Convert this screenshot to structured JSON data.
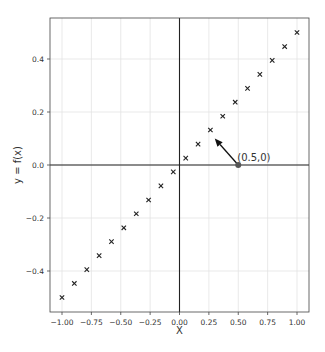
{
  "chart_data": {
    "type": "scatter",
    "title": "",
    "xlabel": "X",
    "ylabel": "y = f(x)",
    "xlim": [
      -1.1,
      1.1
    ],
    "ylim": [
      -0.555,
      0.555
    ],
    "grid": true,
    "legend": null,
    "x_ticks": [
      -1.0,
      -0.75,
      -0.5,
      -0.25,
      0.0,
      0.25,
      0.5,
      0.75,
      1.0
    ],
    "x_tick_labels": [
      "−1.00",
      "−0.75",
      "−0.50",
      "−0.25",
      "0.00",
      "0.25",
      "0.50",
      "0.75",
      "1.00"
    ],
    "y_ticks": [
      -0.4,
      -0.2,
      0.0,
      0.2,
      0.4
    ],
    "y_tick_labels": [
      "−0.4",
      "−0.2",
      "0.0",
      "0.2",
      "0.4"
    ],
    "reference_lines": {
      "axhline_y": 0.0,
      "axvline_x": 0.0
    },
    "series": [
      {
        "name": "f(x)",
        "marker": "x",
        "color": "#222222",
        "x": [
          -1.0,
          -0.895,
          -0.789,
          -0.684,
          -0.579,
          -0.474,
          -0.368,
          -0.263,
          -0.158,
          -0.053,
          0.053,
          0.158,
          0.263,
          0.368,
          0.474,
          0.579,
          0.684,
          0.789,
          0.895,
          1.0
        ],
        "y": [
          -0.5,
          -0.447,
          -0.395,
          -0.342,
          -0.289,
          -0.237,
          -0.184,
          -0.132,
          -0.079,
          -0.026,
          0.026,
          0.079,
          0.132,
          0.184,
          0.237,
          0.289,
          0.342,
          0.395,
          0.447,
          0.5
        ]
      }
    ],
    "annotations": [
      {
        "text": "(0.5,0)",
        "point": [
          0.5,
          0.0
        ],
        "arrow_tip": [
          0.3,
          0.1
        ],
        "marker_color": "#555555"
      }
    ]
  }
}
